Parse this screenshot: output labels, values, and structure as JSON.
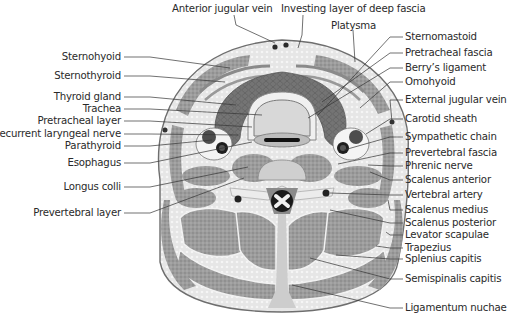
{
  "diagram": {
    "top_labels": [
      {
        "id": "anterior-jugular-vein",
        "text": "Anterior jugular vein"
      },
      {
        "id": "investing-layer",
        "text": "Investing layer of deep fascia"
      },
      {
        "id": "platysma",
        "text": "Platysma"
      }
    ],
    "left_labels": [
      {
        "id": "sternohyoid",
        "text": "Sternohyoid"
      },
      {
        "id": "sternothyroid",
        "text": "Sternothyroid"
      },
      {
        "id": "thyroid-gland",
        "text": "Thyroid gland"
      },
      {
        "id": "trachea",
        "text": "Trachea"
      },
      {
        "id": "pretracheal-layer",
        "text": "Pretracheal layer"
      },
      {
        "id": "recurrent-laryngeal-nerve",
        "text": "Recurrent laryngeal nerve"
      },
      {
        "id": "parathyroid",
        "text": "Parathyroid"
      },
      {
        "id": "esophagus",
        "text": "Esophagus"
      },
      {
        "id": "longus-colli",
        "text": "Longus colli"
      },
      {
        "id": "prevertebral-layer",
        "text": "Prevertebral layer"
      }
    ],
    "right_labels": [
      {
        "id": "sternomastoid",
        "text": "Sternomastoid"
      },
      {
        "id": "pretracheal-fascia",
        "text": "Pretracheal fascia"
      },
      {
        "id": "berrys-ligament",
        "text": "Berry’s ligament"
      },
      {
        "id": "omohyoid",
        "text": "Omohyoid"
      },
      {
        "id": "external-jugular-vein",
        "text": "External jugular vein"
      },
      {
        "id": "carotid-sheath",
        "text": "Carotid sheath"
      },
      {
        "id": "sympathetic-chain",
        "text": "Sympathetic chain"
      },
      {
        "id": "prevertebral-fascia",
        "text": "Prevertebral fascia"
      },
      {
        "id": "phrenic-nerve",
        "text": "Phrenic nerve"
      },
      {
        "id": "scalenus-anterior",
        "text": "Scalenus anterior"
      },
      {
        "id": "vertebral-artery",
        "text": "Vertebral artery"
      },
      {
        "id": "scalenus-medius",
        "text": "Scalenus medius"
      },
      {
        "id": "scalenus-posterior",
        "text": "Scalenus posterior"
      },
      {
        "id": "levator-scapulae",
        "text": "Levator scapulae"
      },
      {
        "id": "trapezius",
        "text": "Trapezius"
      },
      {
        "id": "splenius-capitis",
        "text": "Splenius capitis"
      },
      {
        "id": "semispinalis-capitis",
        "text": "Semispinalis capitis"
      },
      {
        "id": "ligamentum-nuchae",
        "text": "Ligamentum nuchae"
      }
    ],
    "colors": {
      "background": "#ffffff",
      "outline": "#6e6e6e",
      "subcutaneous": "#e4e4e4",
      "muscle": "#9a9a9a",
      "muscle_dark": "#7c7c7c",
      "thyroid": "#6f6f6f",
      "fascia": "#f4f4f4",
      "vessel_dark": "#262626",
      "vessel_mid": "#555555",
      "trachea_fill": "#d9d9d9",
      "vertebra": "#cfcfcf",
      "leader": "#333333",
      "text": "#2a2a2a"
    }
  }
}
